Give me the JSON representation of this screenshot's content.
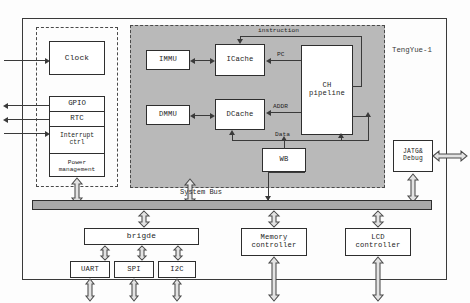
{
  "figure": {
    "chip_label": "TengYue-1",
    "caption": ""
  },
  "peripheral_group": {
    "clock": "Clock",
    "stack": [
      {
        "label": "GPIO"
      },
      {
        "label": "RTC"
      },
      {
        "label": "Interrupt\nctrl"
      },
      {
        "label": "Power\nmanagement"
      }
    ]
  },
  "cpu_core": {
    "immu": "IMMU",
    "dmmu": "DMMU",
    "icache": "ICache",
    "dcache": "DCache",
    "pipeline": "CH\npipeline",
    "wb": "WB",
    "signals": {
      "instruction": "instruction",
      "pc": "PC",
      "addr": "ADDR",
      "data": "Data"
    }
  },
  "debug": {
    "label": "JATG&\nDebug"
  },
  "bus": {
    "label": "System Bus"
  },
  "bottom_blocks": {
    "bridge": "brigde",
    "memory_controller": "Memory\ncontroller",
    "lcd_controller": "LCD\ncontroller",
    "peripherals": [
      {
        "label": "UART"
      },
      {
        "label": "SPI"
      },
      {
        "label": "I2C"
      }
    ]
  },
  "colors": {
    "shade": "#b9b9b9",
    "bus": "#a9a9a9",
    "line": "#3a3a3a",
    "box_border": "#2e2e2e"
  }
}
